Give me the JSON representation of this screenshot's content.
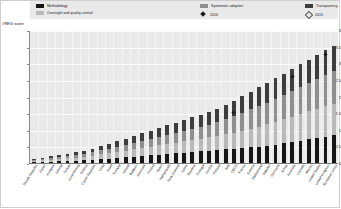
{
  "axis_title": "#REG score",
  "legend": {
    "items": [
      {
        "label": "Methodology",
        "kind": "swatch",
        "color": "#161616"
      },
      {
        "label": "Oversight and quality control",
        "kind": "swatch",
        "color": "#b9b9b9"
      },
      {
        "label": "Systematic adoption",
        "kind": "swatch",
        "color": "#8f8f8f"
      },
      {
        "label": "2016",
        "kind": "marker-filled",
        "color": "#1d1d1d"
      },
      {
        "label": "Transparency",
        "kind": "swatch",
        "color": "#3d3d3d"
      },
      {
        "label": "2015",
        "kind": "marker-hollow",
        "color": "#555555"
      }
    ]
  },
  "chart_data": {
    "type": "bar",
    "title": "",
    "xlabel": "",
    "ylabel": "#REG score",
    "ylim": [
      0,
      4
    ],
    "yticks": [
      "0",
      "0.5",
      "1",
      "1.5",
      "2",
      "2.5",
      "3",
      "3.5",
      "4"
    ],
    "grid": true,
    "stacked": true,
    "legend_position": "top",
    "categories": [
      "Slovak Republic",
      "Japan",
      "Hungary",
      "Iceland",
      "Turkey",
      "Luxembourg",
      "Greece",
      "Czech Republic",
      "Chile",
      "Israel",
      "Norway",
      "Ireland",
      "Belgium",
      "Denmark",
      "Poland",
      "Spain",
      "Netherlands",
      "New Zealand",
      "Latvia",
      "Slovenia",
      "Portugal",
      "Austria",
      "Finland",
      "Italy",
      "OECD",
      "France",
      "Estonia",
      "Switzerland",
      "Sweden",
      "Germany",
      "Korea",
      "Australia",
      "Canada",
      "Mexico",
      "United States",
      "United Kingdom",
      "European Union"
    ],
    "series": [
      {
        "name": "Methodology",
        "values": [
          0.05,
          0.06,
          0.07,
          0.08,
          0.09,
          0.1,
          0.12,
          0.13,
          0.15,
          0.16,
          0.18,
          0.2,
          0.22,
          0.24,
          0.26,
          0.28,
          0.3,
          0.32,
          0.34,
          0.36,
          0.38,
          0.4,
          0.42,
          0.44,
          0.46,
          0.48,
          0.5,
          0.52,
          0.55,
          0.58,
          0.62,
          0.66,
          0.7,
          0.74,
          0.78,
          0.82,
          0.86
        ]
      },
      {
        "name": "Oversight and quality control",
        "values": [
          0.04,
          0.05,
          0.06,
          0.07,
          0.08,
          0.09,
          0.1,
          0.12,
          0.14,
          0.16,
          0.18,
          0.2,
          0.22,
          0.24,
          0.26,
          0.28,
          0.3,
          0.32,
          0.34,
          0.36,
          0.38,
          0.4,
          0.42,
          0.45,
          0.48,
          0.52,
          0.56,
          0.6,
          0.64,
          0.68,
          0.72,
          0.76,
          0.8,
          0.84,
          0.88,
          0.92,
          0.96
        ]
      },
      {
        "name": "Systematic adoption",
        "values": [
          0.03,
          0.04,
          0.05,
          0.06,
          0.07,
          0.08,
          0.09,
          0.1,
          0.12,
          0.14,
          0.16,
          0.18,
          0.2,
          0.22,
          0.24,
          0.26,
          0.28,
          0.3,
          0.32,
          0.34,
          0.36,
          0.38,
          0.42,
          0.46,
          0.5,
          0.54,
          0.58,
          0.62,
          0.66,
          0.7,
          0.74,
          0.78,
          0.82,
          0.86,
          0.9,
          0.94,
          0.98
        ]
      },
      {
        "name": "Transparency",
        "values": [
          0.03,
          0.04,
          0.05,
          0.06,
          0.07,
          0.08,
          0.09,
          0.1,
          0.12,
          0.14,
          0.16,
          0.18,
          0.2,
          0.22,
          0.24,
          0.26,
          0.28,
          0.3,
          0.32,
          0.34,
          0.36,
          0.38,
          0.4,
          0.43,
          0.46,
          0.5,
          0.54,
          0.58,
          0.6,
          0.62,
          0.64,
          0.66,
          0.68,
          0.7,
          0.72,
          0.74,
          0.76
        ]
      }
    ],
    "markers_2016": [
      {
        "index": 24,
        "value": 1.55
      },
      {
        "index": 31,
        "value": 2.62
      },
      {
        "index": 35,
        "value": 3.3
      }
    ],
    "markers_2015": []
  }
}
